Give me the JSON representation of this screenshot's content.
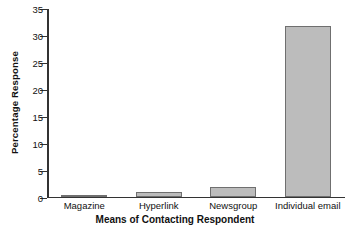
{
  "chart_data": {
    "type": "bar",
    "title": "",
    "xlabel": "Means of Contacting Respondent",
    "ylabel": "Percentage Response",
    "categories": [
      "Magazine",
      "Hyperlink",
      "Newsgroup",
      "Individual email"
    ],
    "values": [
      0.2,
      0.8,
      1.8,
      31.5
    ],
    "ylim": [
      0,
      35
    ],
    "yticks": [
      0,
      5,
      10,
      15,
      20,
      25,
      30,
      35
    ],
    "ytick_labels": [
      "0",
      "5",
      "10",
      "15",
      "20",
      "25",
      "30",
      "35"
    ],
    "grid": false,
    "legend": false,
    "bar_fill_color": "#bcbcbc",
    "bar_edge_color": "#6f6f6f",
    "axis_color": "#333333"
  }
}
